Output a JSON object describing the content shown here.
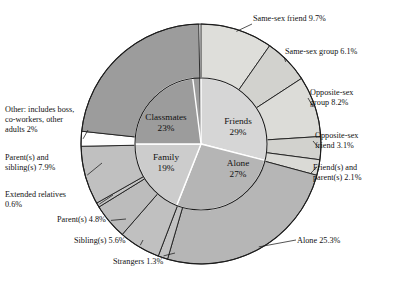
{
  "chart_data": {
    "type": "pie",
    "title": "",
    "subtitle": "",
    "xlabel": "",
    "ylabel": "",
    "legend_position": "none",
    "grid": false,
    "rings": [
      {
        "name": "inner",
        "categories": [
          "Friends",
          "Alone",
          "Family",
          "Classmates"
        ],
        "values": [
          29,
          27,
          19,
          23
        ],
        "unit": "%"
      },
      {
        "name": "outer",
        "categories": [
          "Same-sex friend",
          "Same-sex group",
          "Opposite-sex group",
          "Opposite-sex friend",
          "Friend(s) and parent(s)",
          "Alone",
          "Strangers",
          "Sibling(s)",
          "Parent(s)",
          "Extended relatives",
          "Parent(s) and sibling(s)",
          "Other: includes boss, co-workers, other adults",
          "Classmates"
        ],
        "values": [
          9.7,
          6.1,
          8.2,
          3.1,
          2.1,
          25.3,
          1.3,
          5.6,
          4.8,
          0.6,
          7.9,
          2,
          23
        ],
        "unit": "%"
      }
    ]
  },
  "inner_ring": {
    "slices": [
      {
        "label": "Friends",
        "value": "29%",
        "pct": 29,
        "color": "#d6d6d6"
      },
      {
        "label": "Alone",
        "value": "27%",
        "pct": 27,
        "color": "#b5b5b5"
      },
      {
        "label": "Family",
        "value": "19%",
        "pct": 19,
        "color": "#cccccc"
      },
      {
        "label": "Classmates",
        "value": "23%",
        "pct": 23,
        "color": "#9c9c9c"
      }
    ]
  },
  "outer_ring": {
    "slices": [
      {
        "key": "same-sex-friend",
        "label": "Same-sex friend 9.7%",
        "pct": 9.7,
        "color": "#dededa"
      },
      {
        "key": "same-sex-group",
        "label": "Same-sex group 6.1%",
        "pct": 6.1,
        "color": "#d2d2ce"
      },
      {
        "key": "opposite-sex-group",
        "label": "Opposite-sex\ngroup 8.2%",
        "pct": 8.2,
        "color": "#dcdcd8"
      },
      {
        "key": "opposite-sex-friend",
        "label": "Opposite-sex\nfriend 3.1%",
        "pct": 3.1,
        "color": "#d2d2ce"
      },
      {
        "key": "friends-and-parents",
        "label": "Friend(s) and\nparent(s) 2.1%",
        "pct": 2.1,
        "color": "#dadad6"
      },
      {
        "key": "alone",
        "label": "Alone 25.3%",
        "pct": 25.3,
        "color": "#b6b6b6"
      },
      {
        "key": "strangers",
        "label": "Strangers 1.3%",
        "pct": 1.3,
        "color": "#c2c2c2"
      },
      {
        "key": "siblings",
        "label": "Sibling(s) 5.6%",
        "pct": 5.6,
        "color": "#c0c0c0"
      },
      {
        "key": "parents",
        "label": "Parent(s) 4.8%",
        "pct": 4.8,
        "color": "#bcbcbc"
      },
      {
        "key": "extended-relatives",
        "label": "Extended relatives\n0.6%",
        "pct": 0.6,
        "color": "#c4c4c4"
      },
      {
        "key": "parents-and-siblings",
        "label": "Parent(s) and\nsibling(s) 7.9%",
        "pct": 7.9,
        "color": "#c0c0c0"
      },
      {
        "key": "other",
        "label": "Other: includes boss,\nco-workers, other\nadults 2%",
        "pct": 2,
        "color": "#fdfdfd"
      },
      {
        "key": "classmates",
        "label": "",
        "pct": 23,
        "color": "#9c9c9c"
      }
    ]
  },
  "colors": {
    "outline": "#1c1c1c",
    "background": "#ffffff",
    "text": "#111111",
    "leader_line": "#1c1c1c"
  }
}
